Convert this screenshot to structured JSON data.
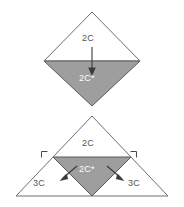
{
  "figures": {
    "top": {
      "name": "diamond-figure",
      "upper_label": "2C",
      "lower_label": "2C*",
      "arrow": "down-arrow"
    },
    "bottom": {
      "name": "triangle-figure",
      "top_label": "2C",
      "inner_label": "2C*",
      "left_label": "3C",
      "right_label": "3C",
      "left_arrow": "down-left-arrow",
      "right_arrow": "down-right-arrow",
      "left_angle_mark": "right-angle-mark",
      "right_angle_mark": "right-angle-mark"
    }
  },
  "colors": {
    "fill_gray": "#9e9e9e",
    "outline_gray": "#6e6e6e",
    "label_dark": "#555555",
    "label_light": "#ffffff",
    "background": "#ffffff"
  }
}
